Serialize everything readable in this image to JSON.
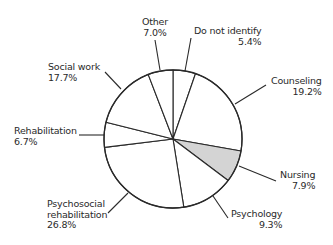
{
  "chart_data": {
    "type": "pie",
    "title": "",
    "start_angle_deg": 0,
    "direction": "clockwise",
    "slices": [
      {
        "label": "Do not identify",
        "value": 5.4,
        "display": "5.4%",
        "fill": "#ffffff",
        "visual_end_deg": 19
      },
      {
        "label": "Counseling",
        "value": 19.2,
        "display": "19.2%",
        "fill": "#ffffff",
        "visual_end_deg": 100
      },
      {
        "label": "Nursing",
        "value": 7.9,
        "display": "7.9%",
        "fill": "#d4d4d4",
        "visual_end_deg": 127
      },
      {
        "label": "Psychology",
        "value": 9.3,
        "display": "9.3%",
        "fill": "#ffffff",
        "visual_end_deg": 171
      },
      {
        "label": "Psychosocial rehabilitation",
        "value": 26.8,
        "display": "26.8%",
        "fill": "#ffffff",
        "visual_end_deg": 263
      },
      {
        "label": "Rehabilitation",
        "value": 6.7,
        "display": "6.7%",
        "fill": "#ffffff",
        "visual_end_deg": 284
      },
      {
        "label": "Social work",
        "value": 17.7,
        "display": "17.7%",
        "fill": "#ffffff",
        "visual_end_deg": 339
      },
      {
        "label": "Other",
        "value": 7.0,
        "display": "7.0%",
        "fill": "#ffffff",
        "visual_end_deg": 360
      }
    ],
    "legend": "none (callout labels with leader lines)"
  },
  "labels": {
    "other": {
      "name": "Other",
      "pct": "7.0%"
    },
    "do_not_identify": {
      "name": "Do not identify",
      "pct": "5.4%"
    },
    "counseling": {
      "name": "Counseling",
      "pct": "19.2%"
    },
    "nursing": {
      "name": "Nursing",
      "pct": "7.9%"
    },
    "psychology": {
      "name": "Psychology",
      "pct": "9.3%"
    },
    "psychosocial": {
      "name1": "Psychosocial",
      "name2": "rehabilitation",
      "pct": "26.8%"
    },
    "rehabilitation": {
      "name": "Rehabilitation",
      "pct": "6.7%"
    },
    "social_work": {
      "name": "Social work",
      "pct": "17.7%"
    }
  },
  "style": {
    "stroke": "#2a2a2a",
    "highlight_fill": "#d4d4d4",
    "background": "#ffffff"
  }
}
